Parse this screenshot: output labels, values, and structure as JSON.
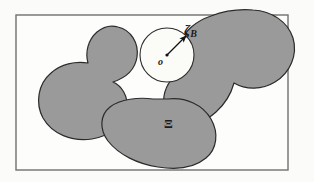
{
  "figure": {
    "background_color": "#fbfbfa",
    "frame": {
      "name": "outer-rectangle",
      "x": 16,
      "y": 15,
      "width": 272,
      "height": 155,
      "stroke_color": "#6f6f6f",
      "fill_color": "#fdfdfc",
      "stroke_width": 1.4
    },
    "region_fill_color": "#9a9a9a",
    "region_stroke_color": "#2b2b2b",
    "ball": {
      "name": "open-ball",
      "center_x": 167,
      "center_y": 55,
      "radius": 27,
      "fill_color": "#fbfbf8",
      "stroke_color": "#2b2b2b"
    },
    "radius_arrow": {
      "from_x": 167,
      "from_y": 55,
      "to_x": 186,
      "to_y": 36,
      "color": "#111111"
    },
    "center_dot": {
      "x": 167,
      "y": 55,
      "radius": 1.6,
      "color": "#111111"
    }
  },
  "labels": {
    "ball_radius": "ζ",
    "ball_radius_subscript": "B",
    "ball_center": "o",
    "set_symbol": "Ξ"
  },
  "shapes": [
    {
      "name": "blob-left",
      "path": "M 118 27 C 131 30 139 43 137 57 C 135 70 125 78 113 82 C 122 86 128 96 127 108 C 125 124 110 136 92 139 C 72 142 52 134 43 118 C 35 103 38 84 51 73 C 61 64 75 61 88 63 C 85 52 88 40 97 32 C 103 27 111 25 118 27 Z"
    },
    {
      "name": "blob-right-diagonal",
      "path": "M 253 10 C 272 11 288 22 293 38 C 298 55 290 73 275 82 C 262 90 246 90 234 83 C 231 94 225 104 216 112 C 205 122 191 127 179 123 C 168 119 162 108 164 96 C 166 84 175 74 186 68 C 180 62 177 53 180 44 C 184 31 196 21 211 16 C 224 11 240 9 253 10 Z"
    },
    {
      "name": "blob-bottom",
      "path": "M 168 99 C 186 97 203 105 211 119 C 219 133 217 149 206 158 C 194 168 176 170 158 167 C 138 164 119 155 108 141 C 99 129 100 115 110 107 C 120 99 139 97 153 99 C 158 99 163 99 168 99 Z"
    }
  ]
}
